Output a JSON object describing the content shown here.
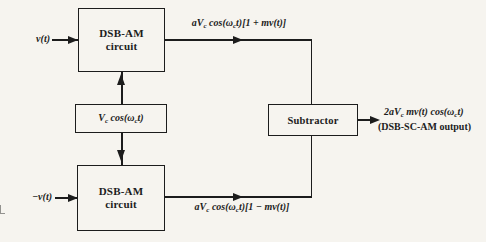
{
  "figure": {
    "colors": {
      "ink": "#1c1c1c",
      "paper": "#f6f4ef"
    }
  },
  "inputs": {
    "top": "v(t)",
    "bottom": "−v(t)"
  },
  "blocks": {
    "dsb_top": {
      "line1": "DSB-AM",
      "line2": "circuit"
    },
    "oscillator": {
      "pre": "V",
      "sub1": "c",
      "mid": " cos(ω",
      "sub2": "c",
      "post": "t)"
    },
    "dsb_bottom": {
      "line1": "DSB-AM",
      "line2": "circuit"
    },
    "subtractor": {
      "label": "Subtractor"
    }
  },
  "signals": {
    "top_output": {
      "pre": "aV",
      "sub1": "c",
      "mid": " cos(ω",
      "sub2": "c",
      "post": "t)[1 + mv(t)]"
    },
    "bottom_output": {
      "pre": "aV",
      "sub1": "c",
      "mid": " cos(ω",
      "sub2": "c",
      "post": "t)[1 − mv(t)]"
    },
    "final_output": {
      "line1": {
        "pre": "2aV",
        "sub1": "c",
        "mid": " mv(t) cos(ω",
        "sub2": "c",
        "post": "t)"
      },
      "line2": "(DSB-SC-AM output)"
    }
  }
}
